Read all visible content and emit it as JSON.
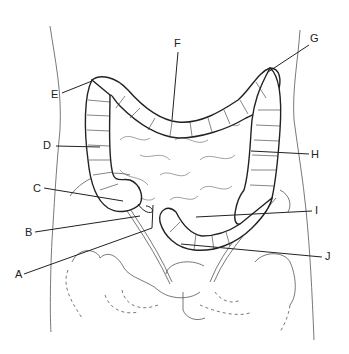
{
  "diagram": {
    "labels": [
      {
        "id": "A",
        "text": "A",
        "x": 15,
        "y": 269,
        "pointer": [
          [
            24,
            274
          ],
          [
            152,
            228
          ],
          [
            153,
            205
          ]
        ]
      },
      {
        "id": "B",
        "text": "B",
        "x": 25,
        "y": 227,
        "pointer": [
          [
            35,
            232
          ],
          [
            140,
            216
          ]
        ]
      },
      {
        "id": "C",
        "text": "C",
        "x": 33,
        "y": 183,
        "pointer": [
          [
            44,
            188
          ],
          [
            123,
            201
          ]
        ]
      },
      {
        "id": "D",
        "text": "D",
        "x": 43,
        "y": 140,
        "pointer": [
          [
            56,
            146
          ],
          [
            100,
            147
          ]
        ]
      },
      {
        "id": "E",
        "text": "E",
        "x": 51,
        "y": 89,
        "pointer": [
          [
            62,
            93
          ],
          [
            92,
            81
          ]
        ]
      },
      {
        "id": "F",
        "text": "F",
        "x": 174,
        "y": 38,
        "pointer": [
          [
            178,
            52
          ],
          [
            172,
            120
          ]
        ]
      },
      {
        "id": "G",
        "text": "G",
        "x": 310,
        "y": 33,
        "pointer": [
          [
            309,
            45
          ],
          [
            268,
            72
          ]
        ]
      },
      {
        "id": "H",
        "text": "H",
        "x": 311,
        "y": 149,
        "pointer": [
          [
            309,
            154
          ],
          [
            251,
            151
          ]
        ]
      },
      {
        "id": "I",
        "text": "I",
        "x": 315,
        "y": 205,
        "pointer": [
          [
            312,
            211
          ],
          [
            196,
            217
          ]
        ]
      },
      {
        "id": "J",
        "text": "J",
        "x": 325,
        "y": 251,
        "pointer": [
          [
            322,
            257
          ],
          [
            181,
            244
          ]
        ]
      }
    ],
    "colors": {
      "line": "#222222",
      "fill": "#ffffff",
      "faint": "#666666"
    }
  }
}
